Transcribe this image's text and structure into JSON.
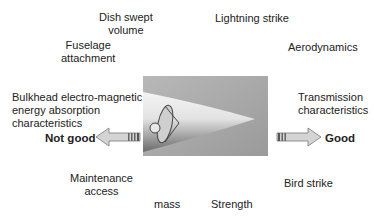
{
  "diagram": {
    "factors": {
      "dish_swept_volume": "Dish swept\nvolume",
      "lightning_strike": "Lightning strike",
      "fuselage_attachment": "Fuselage\nattachment",
      "aerodynamics": "Aerodynamics",
      "bulkhead": "Bulkhead electro-magnetic\nenergy absorption\ncharacteristics",
      "transmission": "Transmission\ncharacteristics",
      "maintenance_access": "Maintenance\naccess",
      "bird_strike": "Bird strike",
      "mass": "mass",
      "strength": "Strength"
    },
    "scale": {
      "left_label": "Not good",
      "right_label": "Good"
    },
    "image": {
      "icon": "radome-nose-cone-with-dish-antenna"
    }
  }
}
